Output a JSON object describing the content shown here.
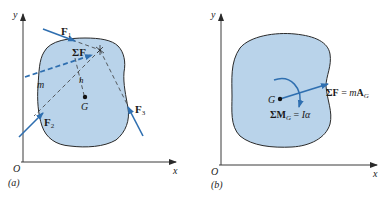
{
  "colors": {
    "blob_fill": "#b9d3ea",
    "blob_stroke": "#2a2a2a",
    "arrow": "#2f6fb0",
    "axis": "#3a3a3a",
    "dashed": "#3a3a3a"
  },
  "panel_a": {
    "caption": "(a)",
    "axis_y_label": "y",
    "axis_x_label": "x",
    "origin_label": "O",
    "mass_label": "m",
    "center_label": "G",
    "moment_arm_label": "h",
    "forces": [
      {
        "symbol": "F",
        "subscript": "1"
      },
      {
        "symbol": "F",
        "subscript": "2"
      },
      {
        "symbol": "F",
        "subscript": "3"
      }
    ],
    "resultant_label": "ΣF"
  },
  "panel_b": {
    "caption": "(b)",
    "axis_y_label": "y",
    "axis_x_label": "x",
    "origin_label": "O",
    "center_label": "G",
    "force_equation": {
      "lhs": "ΣF",
      "eq": " = ",
      "m": "m",
      "A": "A",
      "sub": "G"
    },
    "moment_equation": {
      "lhs": "ΣM",
      "sub": "G",
      "eq": " = ",
      "rhs": "Iα"
    }
  }
}
